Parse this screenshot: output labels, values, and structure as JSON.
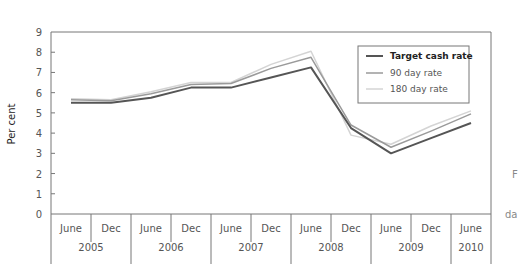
{
  "chart_data": {
    "type": "line",
    "title": "",
    "xlabel": "",
    "ylabel": "Per cent",
    "ylim": [
      0,
      9
    ],
    "yticks": [
      "0",
      "1",
      "2",
      "3",
      "4",
      "5",
      "6",
      "7",
      "8",
      "9"
    ],
    "grid": false,
    "legend_position": "top-right",
    "x": [
      "June 2005",
      "Dec 2005",
      "June 2006",
      "Dec 2006",
      "June 2007",
      "Dec 2007",
      "June 2008",
      "Dec 2008",
      "June 2009",
      "Dec 2009",
      "June 2010"
    ],
    "x_month_labels": [
      "June",
      "Dec",
      "June",
      "Dec",
      "June",
      "Dec",
      "June",
      "Dec",
      "June",
      "Dec",
      "June"
    ],
    "x_year_labels": [
      "2005",
      "2006",
      "2007",
      "2008",
      "2009",
      "2010"
    ],
    "series": [
      {
        "name": "Target cash rate",
        "color": "#555555",
        "values": [
          5.5,
          5.5,
          5.75,
          6.25,
          6.25,
          6.75,
          7.25,
          4.25,
          3.0,
          3.75,
          4.5
        ]
      },
      {
        "name": "90 day rate",
        "color": "#9a9a9a",
        "values": [
          5.65,
          5.6,
          5.95,
          6.4,
          6.45,
          7.2,
          7.75,
          4.4,
          3.3,
          4.1,
          4.95
        ]
      },
      {
        "name": "180 day rate",
        "color": "#d4d4d4",
        "values": [
          5.7,
          5.65,
          6.05,
          6.5,
          6.5,
          7.4,
          8.05,
          3.9,
          3.45,
          4.35,
          5.1
        ]
      }
    ]
  },
  "cut_off_text": [
    "F",
    "da"
  ]
}
